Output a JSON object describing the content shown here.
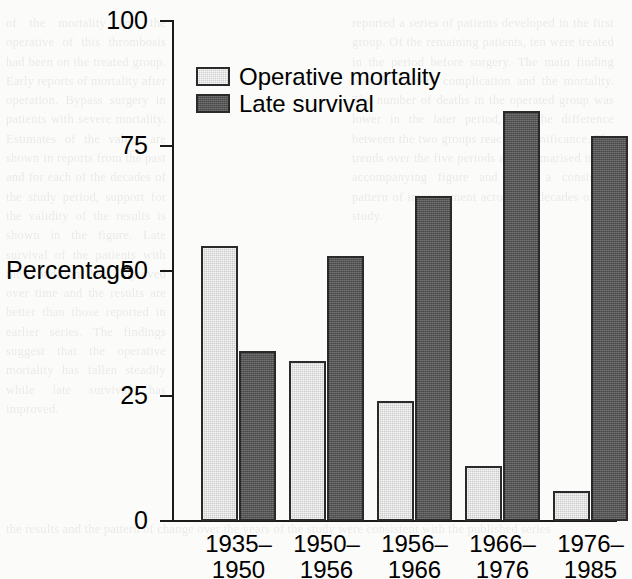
{
  "chart_data": {
    "type": "bar",
    "title": "",
    "subtitle": "",
    "xlabel": "",
    "ylabel": "Percentage",
    "ylim": [
      0,
      100
    ],
    "yticks": [
      0,
      25,
      50,
      75,
      100
    ],
    "ytick_labels": [
      "0",
      "25",
      "50",
      "75",
      "100"
    ],
    "grid": false,
    "legend_position": "top-left-inside",
    "categories": [
      "1935–1950",
      "1950–1956",
      "1956–1966",
      "1966–1976",
      "1976–1985"
    ],
    "category_lines": [
      [
        "1935–",
        "1950"
      ],
      [
        "1950–",
        "1956"
      ],
      [
        "1956–",
        "1966"
      ],
      [
        "1966–",
        "1976"
      ],
      [
        "1976–",
        "1985"
      ]
    ],
    "series": [
      {
        "name": "Operative mortality",
        "color": "#cfcfcf",
        "values": [
          55,
          32,
          24,
          11,
          6
        ]
      },
      {
        "name": "Late survival",
        "color": "#565656",
        "values": [
          34,
          53,
          65,
          82,
          77
        ]
      }
    ]
  },
  "ghost_text": {
    "left": "of the mortality and the operative of this thrombosis had been on the treated group. Early reports of mortality after operation. Bypass surgery in patients with severe mortality. Estimates of the values are shown in reports from the past and for each of the decades of the study period, support for the validity of the results is shown in the figure. Late survival of the patients with the condition has improved over time and the results are better than those reported in earlier series. The findings suggest that the operative mortality has fallen steadily while late survival has improved.",
    "right": "reported a series of patients developed in the first group. Of the remaining patients, ten were treated in the period before surgery. The main finding was the rate of complication and the mortality. The number of deaths in the operated group was lower in the later period, and the difference between the two groups reached significance. The trends over the five periods are summarised in the accompanying figure and show a consistent pattern of improvement across the decades of the study.",
    "bottom": "the results and the pattern of change over the years of the study were consistent with the published series"
  }
}
